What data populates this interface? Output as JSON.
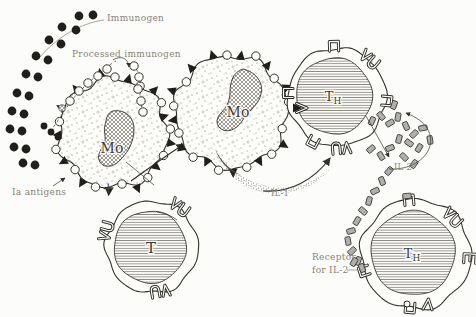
{
  "figure": {
    "type": "immunology-pathway-diagram",
    "background": "#fcfcfa",
    "ink_color": "#34312b",
    "label_color": "#8a8478",
    "labels": {
      "immunogen": "Immunogen",
      "processed_immunogen": "Processed immunogen",
      "macrophage_1": "Mo",
      "ia_antigens": "Ia antigens",
      "plus": "+",
      "t_cell": "T",
      "macrophage_2": "Mo",
      "il_1": "IL-1",
      "t_helper_main": "T",
      "t_helper_sub": "H",
      "il_2": "IL-2",
      "receptor_for_il2_line1": "Receptor",
      "receptor_for_il2_line2": "for IL-2"
    }
  }
}
